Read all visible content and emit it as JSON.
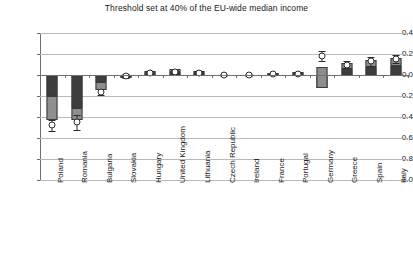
{
  "chart_data": {
    "type": "bar",
    "title": "Threshold set at 40% of the EU-wide median income",
    "xlabel": "",
    "ylabel": "",
    "ylim": [
      -1.0,
      0.4
    ],
    "ytick_labels": [
      "0.4",
      "0.2",
      "0.0",
      "-0.2",
      "-0.4",
      "-0.6",
      "-0.8",
      "-1.0"
    ],
    "ytick_values": [
      0.4,
      0.2,
      0.0,
      -0.2,
      -0.4,
      -0.6,
      -0.8,
      -1.0
    ],
    "grid": true,
    "legend_position": "none",
    "categories": [
      "Poland",
      "Romania",
      "Bulgaria",
      "Slovakia",
      "Hungary",
      "United Kingdom",
      "Lithuania",
      "Czech Republic",
      "Ireland",
      "France",
      "Portugal",
      "Germany",
      "Greece",
      "Spain",
      "Italy"
    ],
    "series": [
      {
        "name": "Lower bar segment (dark)",
        "values": [
          -0.2,
          -0.31,
          -0.07,
          -0.01,
          0.02,
          0.03,
          0.02,
          0.0,
          0.0,
          0.01,
          0.01,
          -0.12,
          0.06,
          0.08,
          0.09
        ]
      },
      {
        "name": "Upper bar segment (light)",
        "values": [
          -0.23,
          -0.12,
          -0.07,
          -0.02,
          0.02,
          0.03,
          0.02,
          0.0,
          0.0,
          0.01,
          0.02,
          0.2,
          0.05,
          0.06,
          0.07
        ]
      }
    ],
    "markers": {
      "name": "Point estimate with 95% interval",
      "values": [
        -0.48,
        -0.45,
        -0.16,
        -0.01,
        0.02,
        0.03,
        0.02,
        0.0,
        0.0,
        0.01,
        0.01,
        0.18,
        0.1,
        0.13,
        0.15
      ],
      "error_low": [
        -0.53,
        -0.52,
        -0.19,
        -0.03,
        0.0,
        0.01,
        0.0,
        -0.01,
        -0.01,
        0.0,
        0.0,
        0.13,
        0.07,
        0.09,
        0.11
      ],
      "error_high": [
        -0.43,
        -0.38,
        -0.13,
        0.01,
        0.04,
        0.05,
        0.04,
        0.01,
        0.01,
        0.02,
        0.02,
        0.23,
        0.13,
        0.17,
        0.19
      ]
    },
    "colors": {
      "dark_segment": "#3d3d3d",
      "light_segment": "#8e8e8e",
      "marker_fill": "#ffffff",
      "marker_edge": "#2b2b2b",
      "gridline": "#b9b9b9",
      "axis": "#6f6f6f",
      "background": "#ffffff",
      "text": "#1a1a1a"
    }
  }
}
